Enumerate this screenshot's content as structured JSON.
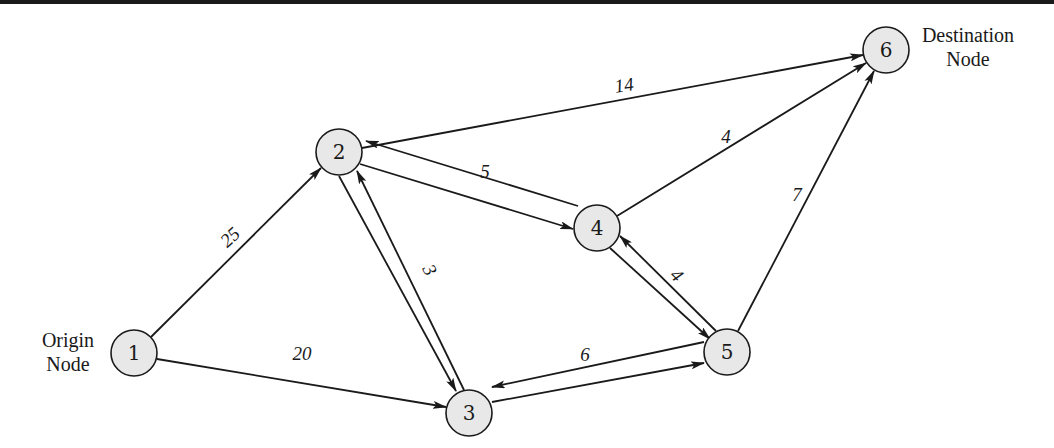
{
  "diagram": {
    "type": "directed-network",
    "annotations": {
      "origin": {
        "line1": "Origin",
        "line2": "Node"
      },
      "destination": {
        "line1": "Destination",
        "line2": "Node"
      }
    },
    "nodes": [
      {
        "id": "1",
        "label": "1",
        "x": 134,
        "y": 353
      },
      {
        "id": "2",
        "label": "2",
        "x": 339,
        "y": 152
      },
      {
        "id": "3",
        "label": "3",
        "x": 469,
        "y": 413
      },
      {
        "id": "4",
        "label": "4",
        "x": 597,
        "y": 228
      },
      {
        "id": "5",
        "label": "5",
        "x": 727,
        "y": 352
      },
      {
        "id": "6",
        "label": "6",
        "x": 886,
        "y": 50
      }
    ],
    "edges": [
      {
        "from": "1",
        "to": "2",
        "weight": "25"
      },
      {
        "from": "1",
        "to": "3",
        "weight": "20"
      },
      {
        "from": "2",
        "to": "6",
        "weight": "14"
      },
      {
        "from": "2",
        "to": "4",
        "weight": "5",
        "bidirectional": true
      },
      {
        "from": "2",
        "to": "3",
        "weight": "3",
        "bidirectional": true
      },
      {
        "from": "4",
        "to": "6",
        "weight": "4"
      },
      {
        "from": "4",
        "to": "5",
        "weight": "4",
        "bidirectional": true
      },
      {
        "from": "3",
        "to": "5",
        "weight": "6",
        "bidirectional": true
      },
      {
        "from": "5",
        "to": "6",
        "weight": "7"
      }
    ],
    "weight_labels": {
      "e12": "25",
      "e13": "20",
      "e26": "14",
      "e24": "5",
      "e23": "3",
      "e46": "4",
      "e45": "4",
      "e35": "6",
      "e56": "7"
    }
  }
}
